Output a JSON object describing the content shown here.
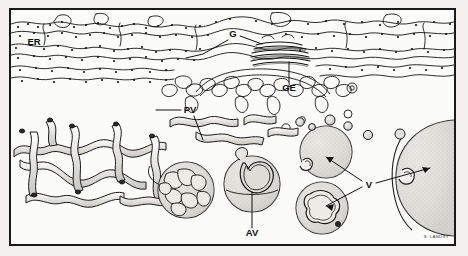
{
  "figure": {
    "frame_color": "#1a1a1a",
    "background_color": "#f2f1ed",
    "ink_color": "#111111",
    "fill_color": "#d9d7d2",
    "credit": "S. LANDRY"
  },
  "labels": [
    {
      "id": "er",
      "text": "ER",
      "name": "label-er",
      "x": 34,
      "y": 45
    },
    {
      "id": "g",
      "text": "G",
      "name": "label-g",
      "x": 231,
      "y": 36
    },
    {
      "id": "ge",
      "text": "GE",
      "name": "label-ge",
      "x": 287,
      "y": 87
    },
    {
      "id": "pv",
      "text": "PV",
      "name": "label-pv",
      "x": 186,
      "y": 112
    },
    {
      "id": "av",
      "text": "AV",
      "name": "label-av",
      "x": 248,
      "y": 233
    },
    {
      "id": "v",
      "text": "V",
      "name": "label-v",
      "x": 368,
      "y": 184
    }
  ],
  "leaders": [
    {
      "name": "leader-g-left",
      "d": "M228,40 L203,54 L186,58"
    },
    {
      "name": "leader-g-right",
      "d": "M240,36 L262,44"
    },
    {
      "name": "leader-ge",
      "d": "M289,82 L289,62"
    },
    {
      "name": "leader-pv-left",
      "d": "M184,110 L160,110"
    },
    {
      "name": "leader-pv-down",
      "d": "M194,115 L203,138"
    },
    {
      "name": "leader-av",
      "d": "M252,228 L252,192"
    },
    {
      "name": "leader-v-up",
      "d": "M364,182 L330,157"
    },
    {
      "name": "leader-v-down",
      "d": "M364,188 L330,208"
    },
    {
      "name": "leader-v-right",
      "d": "M376,184 L428,170"
    }
  ],
  "regions": [
    {
      "name": "er-band",
      "description": "Rough endoplasmic reticulum cisternae with ribosomes, upper band"
    },
    {
      "name": "golgi-stack",
      "description": "Stacked flattened Golgi cisternae"
    },
    {
      "name": "golgi-exit-zone",
      "description": "Golgi exit / GERL region beneath the stack"
    },
    {
      "name": "tubular-network",
      "description": "Branching tubular network, lower left"
    },
    {
      "name": "coiled-vacuole",
      "description": "Sphere enclosing coiled tubules"
    },
    {
      "name": "autophagic-vacuole",
      "description": "Vacuole engulfing organelle profile"
    },
    {
      "name": "vesicle-cluster",
      "description": "Stippled vesicles with membrane invaginations"
    },
    {
      "name": "large-vesicle",
      "description": "Large stippled vesicle at right edge"
    }
  ]
}
